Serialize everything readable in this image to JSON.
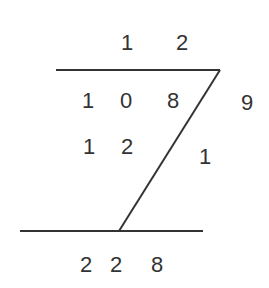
{
  "diagram": {
    "type": "lattice-style multiplication/division working",
    "colors": {
      "ink": "#333333",
      "background": "#ffffff"
    },
    "top_row": [
      {
        "value": "1",
        "x": 127,
        "y": 43
      },
      {
        "value": "2",
        "x": 182,
        "y": 43
      }
    ],
    "row_1": [
      {
        "value": "1",
        "x": 88,
        "y": 101
      },
      {
        "value": "0",
        "x": 126,
        "y": 101
      },
      {
        "value": "8",
        "x": 173,
        "y": 101
      }
    ],
    "right_1": {
      "value": "9",
      "x": 247,
      "y": 103
    },
    "row_2": [
      {
        "value": "1",
        "x": 89,
        "y": 147
      },
      {
        "value": "2",
        "x": 127,
        "y": 147
      }
    ],
    "right_2": {
      "value": "1",
      "x": 205,
      "y": 157
    },
    "result_row": [
      {
        "value": "2",
        "x": 86,
        "y": 265
      },
      {
        "value": "2",
        "x": 116,
        "y": 265
      },
      {
        "value": "8",
        "x": 157,
        "y": 265
      }
    ],
    "lines": {
      "top": {
        "x1": 56,
        "y1": 70,
        "x2": 220,
        "y2": 70
      },
      "diagonal": {
        "x1": 220,
        "y1": 70,
        "x2": 119,
        "y2": 231
      },
      "bottom": {
        "x1": 20,
        "y1": 231,
        "x2": 203,
        "y2": 231
      }
    }
  }
}
